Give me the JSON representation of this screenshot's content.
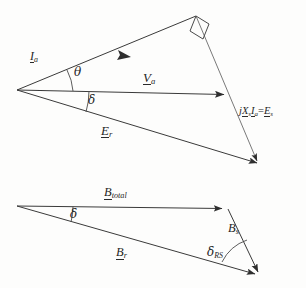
{
  "figure": {
    "type": "phasor-vector-diagram",
    "title_visible": "",
    "background_color": "#fdfdfc",
    "line_color": "#3a3a3a"
  },
  "top_diagram": {
    "name": "voltage-phasor-triangle",
    "labels": {
      "armature_current": {
        "base": "I",
        "sub": "a",
        "underlined": true
      },
      "terminal_voltage": {
        "base": "V",
        "sub": "a",
        "underlined": true
      },
      "resultant_emf": {
        "base": "E",
        "sub": "r",
        "underlined": true
      },
      "reactance_drop": {
        "text_parts": [
          "j",
          "X",
          "s",
          "I",
          "a",
          "=",
          "E",
          "s"
        ],
        "display": "jXsIa=Es"
      },
      "theta_angle": "θ",
      "delta_angle": "δ"
    },
    "vectors": [
      {
        "name": "I_a",
        "from": [
          17,
          90
        ],
        "to": [
          196,
          16
        ],
        "arrow_at": [
          120,
          56
        ]
      },
      {
        "name": "V_a",
        "from": [
          17,
          90
        ],
        "to": [
          230,
          95
        ],
        "arrow_at": [
          230,
          95
        ]
      },
      {
        "name": "E_r",
        "from": [
          17,
          90
        ],
        "to": [
          263,
          166
        ],
        "arrow_at": [
          263,
          166
        ]
      },
      {
        "name": "jXsIa=Es",
        "from": [
          196,
          16
        ],
        "to": [
          263,
          166
        ],
        "arrow_at": null
      }
    ],
    "right_angle_marker": {
      "at": [
        196,
        16
      ],
      "present": true
    },
    "angles": [
      {
        "symbol": "θ",
        "between": [
          "I_a",
          "V_a"
        ],
        "vertex": [
          17,
          90
        ]
      },
      {
        "symbol": "δ",
        "between": [
          "V_a",
          "E_r"
        ],
        "vertex": [
          17,
          90
        ]
      }
    ]
  },
  "bottom_diagram": {
    "name": "flux-density-triangle",
    "labels": {
      "total_flux": {
        "base": "B",
        "sub": "total",
        "underlined": true
      },
      "rotor_flux": {
        "base": "B",
        "sub": "r",
        "underlined": true
      },
      "stator_flux": {
        "base": "B",
        "sub": "s",
        "underlined": false
      },
      "delta_angle": "δ",
      "delta_rs_angle": {
        "base": "δ",
        "sub": "RS"
      }
    },
    "vectors": [
      {
        "name": "B_total",
        "from": [
          17,
          206
        ],
        "to": [
          228,
          209
        ],
        "arrow_at": [
          228,
          209
        ]
      },
      {
        "name": "B_r",
        "from": [
          17,
          206
        ],
        "to": [
          261,
          277
        ],
        "arrow_at": [
          261,
          277
        ]
      },
      {
        "name": "B_s",
        "from": [
          228,
          209
        ],
        "to": [
          261,
          277
        ],
        "arrow_at": [
          261,
          277
        ]
      }
    ],
    "angles": [
      {
        "symbol": "δ",
        "between": [
          "B_total",
          "B_r"
        ],
        "vertex": [
          17,
          206
        ]
      },
      {
        "symbol": "δRS",
        "between": [
          "B_s",
          "B_r"
        ],
        "vertex": [
          261,
          277
        ]
      }
    ]
  }
}
